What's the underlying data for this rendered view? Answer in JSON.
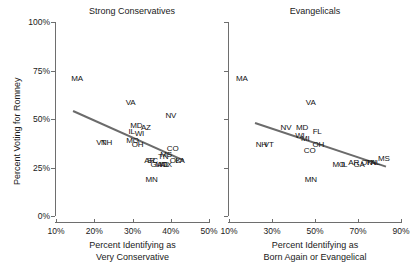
{
  "figure": {
    "ylabel": "Percent Voting for Romney",
    "y_ticks": [
      "0%",
      "25%",
      "50%",
      "75%",
      "100%"
    ],
    "y_tick_values": [
      0,
      25,
      50,
      75,
      100
    ]
  },
  "chart_data": [
    {
      "type": "scatter",
      "title": "Strong Conservatives",
      "xlabel": "Percent Identifying as Very Conservative",
      "xlabel_line1": "Percent Identifying as",
      "xlabel_line2": "Very Conservative",
      "ylabel": "Percent Voting for Romney",
      "xlim": [
        10,
        50
      ],
      "ylim": [
        0,
        100
      ],
      "x_ticks": [
        "10%",
        "20%",
        "30%",
        "40%",
        "50%"
      ],
      "x_tick_values": [
        10,
        20,
        30,
        40,
        50
      ],
      "grid": false,
      "legend": "none",
      "point_marker": "state-abbreviation-text",
      "points": [
        {
          "label": "MA",
          "x": 15.5,
          "y": 71
        },
        {
          "label": "VA",
          "x": 29.5,
          "y": 59
        },
        {
          "label": "MD",
          "x": 31.0,
          "y": 47
        },
        {
          "label": "AZ",
          "x": 33.5,
          "y": 46
        },
        {
          "label": "IL",
          "x": 29.8,
          "y": 44
        },
        {
          "label": "WI",
          "x": 31.8,
          "y": 43
        },
        {
          "label": "MO",
          "x": 30.0,
          "y": 39
        },
        {
          "label": "OH",
          "x": 31.3,
          "y": 37
        },
        {
          "label": "VT",
          "x": 21.8,
          "y": 38
        },
        {
          "label": "NH",
          "x": 23.2,
          "y": 38
        },
        {
          "label": "NV",
          "x": 40.0,
          "y": 52
        },
        {
          "label": "CO",
          "x": 40.5,
          "y": 35
        },
        {
          "label": "TN",
          "x": 38.0,
          "y": 31
        },
        {
          "label": "MS",
          "x": 38.8,
          "y": 32
        },
        {
          "label": "SC",
          "x": 35.2,
          "y": 29
        },
        {
          "label": "AR",
          "x": 34.5,
          "y": 29
        },
        {
          "label": "GA",
          "x": 36.2,
          "y": 27
        },
        {
          "label": "MO",
          "x": 37.6,
          "y": 27
        },
        {
          "label": "OK",
          "x": 41.2,
          "y": 29
        },
        {
          "label": "LA",
          "x": 42.4,
          "y": 29
        },
        {
          "label": "TX",
          "x": 39.0,
          "y": 27
        },
        {
          "label": "AL",
          "x": 38.4,
          "y": 27
        },
        {
          "label": "MN",
          "x": 35.0,
          "y": 19
        }
      ],
      "trend_line": {
        "x1": 14.5,
        "y1": 54.5,
        "x2": 43.5,
        "y2": 29.0,
        "color": "#6b6b6b"
      }
    },
    {
      "type": "scatter",
      "title": "Evangelicals",
      "xlabel": "Percent Identifying as Born Again or Evangelical",
      "xlabel_line1": "Percent Identifying as",
      "xlabel_line2": "Born Again or Evangelical",
      "ylabel": "Percent Voting for Romney",
      "xlim": [
        10,
        90
      ],
      "ylim": [
        0,
        100
      ],
      "x_ticks": [
        "10%",
        "30%",
        "50%",
        "70%",
        "90%"
      ],
      "x_tick_values": [
        10,
        30,
        50,
        70,
        90
      ],
      "grid": false,
      "legend": "none",
      "point_marker": "state-abbreviation-text",
      "points": [
        {
          "label": "MA",
          "x": 16.0,
          "y": 71
        },
        {
          "label": "VA",
          "x": 48.0,
          "y": 59
        },
        {
          "label": "NV",
          "x": 36.5,
          "y": 46
        },
        {
          "label": "MD",
          "x": 44.0,
          "y": 46
        },
        {
          "label": "FL",
          "x": 51.0,
          "y": 44
        },
        {
          "label": "WI",
          "x": 43.0,
          "y": 42
        },
        {
          "label": "MI",
          "x": 45.5,
          "y": 40
        },
        {
          "label": "OH",
          "x": 51.5,
          "y": 37
        },
        {
          "label": "CO",
          "x": 47.5,
          "y": 34
        },
        {
          "label": "NH",
          "x": 25.0,
          "y": 37
        },
        {
          "label": "VT",
          "x": 28.5,
          "y": 37
        },
        {
          "label": "MN",
          "x": 48.0,
          "y": 19
        },
        {
          "label": "MO",
          "x": 61.0,
          "y": 27
        },
        {
          "label": "IL",
          "x": 63.5,
          "y": 27
        },
        {
          "label": "AR",
          "x": 68.0,
          "y": 28
        },
        {
          "label": "GA",
          "x": 70.5,
          "y": 27
        },
        {
          "label": "OK",
          "x": 74.0,
          "y": 28
        },
        {
          "label": "TN",
          "x": 76.0,
          "y": 28
        },
        {
          "label": "AL",
          "x": 78.0,
          "y": 28
        },
        {
          "label": "MS",
          "x": 82.0,
          "y": 30
        }
      ],
      "trend_line": {
        "x1": 22.0,
        "y1": 48.5,
        "x2": 83.0,
        "y2": 26.0,
        "color": "#6b6b6b"
      }
    }
  ]
}
